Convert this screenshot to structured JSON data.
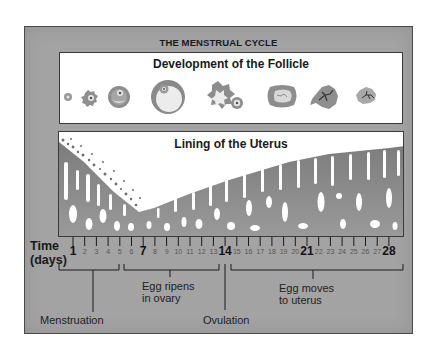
{
  "title": "THE MENSTRUAL CYCLE",
  "follicle_panel": {
    "title": "Development of the Follicle",
    "stages": [
      {
        "stage": 1,
        "name": "primordial-follicle"
      },
      {
        "stage": 2,
        "name": "primary-follicle"
      },
      {
        "stage": 3,
        "name": "secondary-follicle"
      },
      {
        "stage": 4,
        "name": "mature-follicle"
      },
      {
        "stage": 5,
        "name": "ruptured-follicle-with-ovum"
      },
      {
        "stage": 6,
        "name": "corpus-luteum"
      },
      {
        "stage": 7,
        "name": "regressing-corpus-luteum"
      },
      {
        "stage": 8,
        "name": "corpus-albicans"
      }
    ]
  },
  "uterus_panel": {
    "title": "Lining of the Uterus"
  },
  "axis": {
    "label_line1": "Time",
    "label_line2": "(days)",
    "days": [
      "1",
      "2",
      "3",
      "4",
      "5",
      "6",
      "7",
      "8",
      "9",
      "10",
      "11",
      "12",
      "13",
      "14",
      "15",
      "16",
      "17",
      "18",
      "19",
      "20",
      "21",
      "22",
      "23",
      "24",
      "25",
      "26",
      "27",
      "28"
    ],
    "major_days": [
      "1",
      "7",
      "14",
      "21",
      "28"
    ]
  },
  "phases": [
    {
      "label": "Menstruation",
      "days": "1-5"
    },
    {
      "label_line1": "Egg ripens",
      "label_line2": "in ovary",
      "days": "6-13"
    },
    {
      "label": "Ovulation",
      "days": "14"
    },
    {
      "label_line1": "Egg moves",
      "label_line2": "to uterus",
      "days": "15-28"
    }
  ],
  "colors": {
    "frame": "#a3a3a3",
    "panel": "#ffffff",
    "tissue": "#8c8c8c",
    "follicle": "#9a9a9a"
  }
}
